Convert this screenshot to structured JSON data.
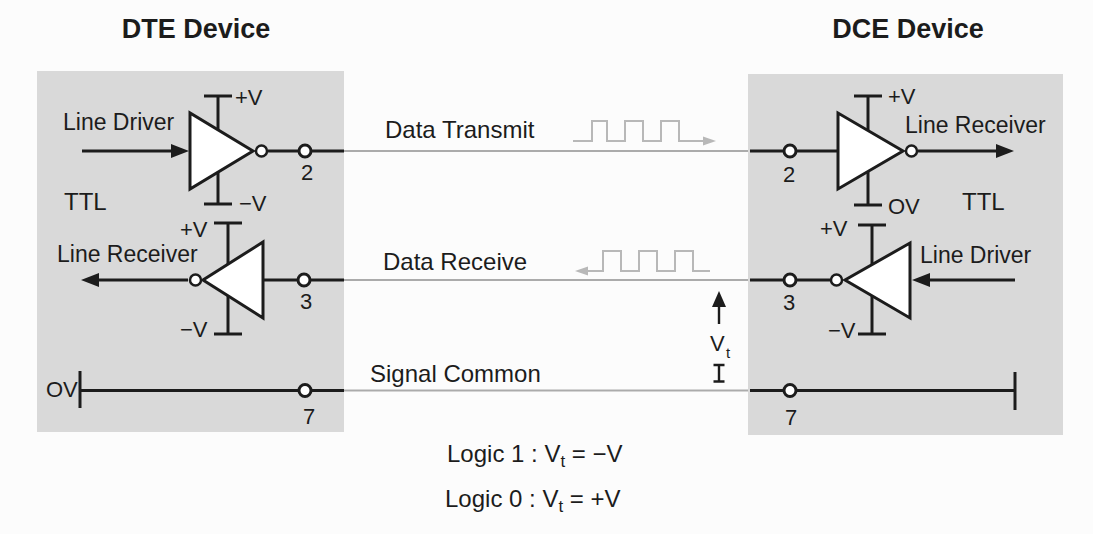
{
  "dte": {
    "title": "DTE Device",
    "ttl": "TTL",
    "driver": {
      "label": "Line Driver",
      "vplus": "+V",
      "vminus": "−V"
    },
    "receiver": {
      "label": "Line Receiver",
      "vplus": "+V",
      "vminus": "−V"
    },
    "common_ref": "OV",
    "pin_transmit": "2",
    "pin_receive": "3",
    "pin_common": "7"
  },
  "dce": {
    "title": "DCE Device",
    "ttl": "TTL",
    "receiver": {
      "label": "Line Receiver",
      "vplus": "+V",
      "vzero": "OV"
    },
    "driver": {
      "label": "Line Driver",
      "vplus": "+V",
      "vminus": "−V"
    },
    "pin_transmit": "2",
    "pin_receive": "3",
    "pin_common": "7"
  },
  "signals": {
    "transmit_label": "Data Transmit",
    "receive_label": "Data Receive",
    "common_label": "Signal Common",
    "vt_symbol": "V",
    "vt_subscript": "t"
  },
  "legend": {
    "logic1": {
      "prefix": "Logic 1 : V",
      "sub": "t",
      "suffix": " = −V"
    },
    "logic0": {
      "prefix": "Logic 0 : V",
      "sub": "t",
      "suffix": " = +V"
    }
  },
  "colors": {
    "box_bg": "#d9d9d9",
    "ink": "#1c1c1c",
    "wire": "#ababab",
    "waveform": "#b8b8b8"
  }
}
